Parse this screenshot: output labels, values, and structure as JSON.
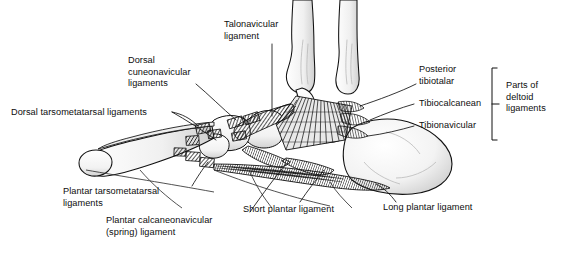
{
  "figure": {
    "background_color": "#ffffff",
    "ink_color": "#000000",
    "bone_fill": "#fbfbfb",
    "bone_shade": "#d8d8d8",
    "ligament_hatch": "#2a2a2a"
  },
  "labels": {
    "dorsal_cuneonavicular": {
      "line1": "Dorsal",
      "line2": "cuneonavicular",
      "line3": "ligaments"
    },
    "talonavicular": {
      "line1": "Talonavicular",
      "line2": "ligament"
    },
    "dorsal_tarsometatarsal": {
      "line1": "Dorsal tarsometatarsal ligaments"
    },
    "posterior_tibiotalar": {
      "line1": "Posterior",
      "line2": "tibiotalar"
    },
    "tibiocalcanean": {
      "line1": "Tibiocalcanean"
    },
    "tibionavicular": {
      "line1": "Tibionavicular"
    },
    "parts_of_deltoid": {
      "line1": "Parts of",
      "line2": "deltoid",
      "line3": "ligaments"
    },
    "plantar_tarsometatarsal": {
      "line1": "Plantar tarsometatarsal",
      "line2": "ligaments"
    },
    "plantar_calcaneonavicular": {
      "line1": "Plantar calcaneonavicular",
      "line2": "(spring) ligament"
    },
    "short_plantar": {
      "line1": "Short plantar ligament"
    },
    "long_plantar": {
      "line1": "Long plantar ligament"
    }
  }
}
